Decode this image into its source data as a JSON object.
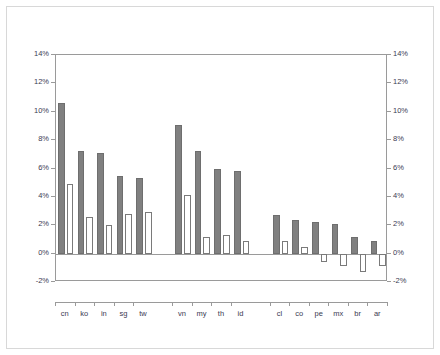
{
  "chart_data": {
    "type": "bar",
    "title": "",
    "subtitle": "",
    "xlabel": "",
    "ylabel": "",
    "ylim": [
      -2,
      14
    ],
    "ytick_labels": [
      "14%",
      "12%",
      "10%",
      "8%",
      "6%",
      "4%",
      "2%",
      "0%",
      "-2%"
    ],
    "ytick_values": [
      14,
      12,
      10,
      8,
      6,
      4,
      2,
      0,
      -2
    ],
    "right_axis": true,
    "right_ytick_labels": [
      "14%",
      "12%",
      "10%",
      "8%",
      "6%",
      "4%",
      "2%",
      "0%",
      "-2%"
    ],
    "grid": false,
    "legend_position": "top-right",
    "categories": [
      "cn",
      "ko",
      "in",
      "sg",
      "tw",
      "vn",
      "my",
      "th",
      "id",
      "cl",
      "co",
      "pe",
      "mx",
      "br",
      "ar"
    ],
    "group_breaks": [
      5,
      9
    ],
    "series": [
      {
        "name": "mf",
        "color": "#808080",
        "values": [
          10.6,
          7.2,
          7.1,
          5.5,
          5.3,
          9.1,
          7.2,
          6.0,
          5.8,
          2.7,
          2.4,
          2.2,
          2.1,
          1.2,
          0.9
        ]
      },
      {
        "name": "prod non-mf",
        "color": "#ffffff",
        "values": [
          4.9,
          2.6,
          2.0,
          2.8,
          2.9,
          4.1,
          1.2,
          1.3,
          0.9,
          0.9,
          0.5,
          -0.6,
          -0.9,
          -1.3,
          -0.9
        ]
      }
    ]
  },
  "legend": {
    "items": [
      {
        "label": "mf",
        "swatch": "mf"
      },
      {
        "label": "prod non-mf",
        "swatch": "nonmf"
      }
    ]
  },
  "colors": {
    "mf_fill": "#808080",
    "nonmf_fill": "#ffffff",
    "axis": "#9a9a9a",
    "text": "#3a3a52",
    "frame": "#d8d8d8",
    "background": "#ffffff"
  }
}
